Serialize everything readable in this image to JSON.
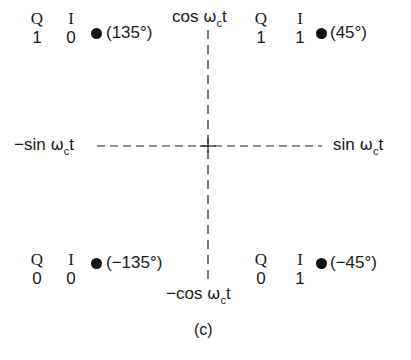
{
  "axes": {
    "top": {
      "prefix": "cos ",
      "omega": "ω",
      "sub": "c",
      "suffix": "t"
    },
    "bottom": {
      "prefix": "−cos ",
      "omega": "ω",
      "sub": "c",
      "suffix": "t"
    },
    "left": {
      "prefix": "−sin ",
      "omega": "ω",
      "sub": "c",
      "suffix": "t"
    },
    "right": {
      "prefix": "sin ",
      "omega": "ω",
      "sub": "c",
      "suffix": "t"
    }
  },
  "points": [
    {
      "q_label": "Q",
      "i_label": "I",
      "q": "1",
      "i": "0",
      "phase": "(135°)"
    },
    {
      "q_label": "Q",
      "i_label": "I",
      "q": "1",
      "i": "1",
      "phase": "(45°)"
    },
    {
      "q_label": "Q",
      "i_label": "I",
      "q": "0",
      "i": "0",
      "phase": "(−135°)"
    },
    {
      "q_label": "Q",
      "i_label": "I",
      "q": "0",
      "i": "1",
      "phase": "(−45°)"
    }
  ],
  "caption": "(c)"
}
